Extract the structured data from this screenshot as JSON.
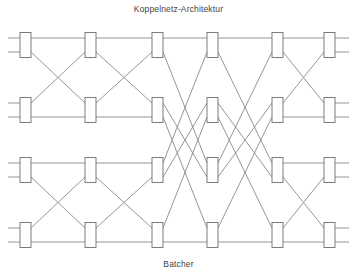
{
  "figure": {
    "title": "Koppelnetz-Architektur",
    "caption": "Batcher",
    "type": "diagram",
    "subtype": "sorting-network",
    "colors": {
      "background": "#ffffff",
      "wire": "#8a8a8a",
      "box_stroke": "#6e6e6e",
      "box_fill": "#ffffff",
      "text": "#3f3f3f"
    },
    "canvas": {
      "width": 357,
      "height": 278
    },
    "wire_rows_y": [
      38,
      52,
      103,
      117,
      163,
      177,
      228,
      242
    ],
    "wire_x_start": 8,
    "wire_x_end": 349,
    "stage_x": [
      20,
      85,
      152,
      207,
      272,
      324
    ],
    "box_width": 11,
    "stages": [
      {
        "index": 1,
        "x": 20,
        "boxes": [
          {
            "top_row": 0,
            "bottom_row": 1
          },
          {
            "top_row": 2,
            "bottom_row": 3
          },
          {
            "top_row": 4,
            "bottom_row": 5
          },
          {
            "top_row": 6,
            "bottom_row": 7
          }
        ]
      },
      {
        "index": 2,
        "x": 85,
        "boxes": [
          {
            "top_row": 0,
            "bottom_row": 1
          },
          {
            "top_row": 2,
            "bottom_row": 3
          },
          {
            "top_row": 4,
            "bottom_row": 5
          },
          {
            "top_row": 6,
            "bottom_row": 7
          }
        ]
      },
      {
        "index": 3,
        "x": 152,
        "boxes": [
          {
            "top_row": 0,
            "bottom_row": 1
          },
          {
            "top_row": 2,
            "bottom_row": 3
          },
          {
            "top_row": 4,
            "bottom_row": 5
          },
          {
            "top_row": 6,
            "bottom_row": 7
          }
        ]
      },
      {
        "index": 4,
        "x": 207,
        "boxes": [
          {
            "top_row": 0,
            "bottom_row": 1
          },
          {
            "top_row": 2,
            "bottom_row": 3
          },
          {
            "top_row": 4,
            "bottom_row": 5
          },
          {
            "top_row": 6,
            "bottom_row": 7
          }
        ]
      },
      {
        "index": 5,
        "x": 272,
        "boxes": [
          {
            "top_row": 0,
            "bottom_row": 1
          },
          {
            "top_row": 2,
            "bottom_row": 3
          },
          {
            "top_row": 4,
            "bottom_row": 5
          },
          {
            "top_row": 6,
            "bottom_row": 7
          }
        ]
      },
      {
        "index": 6,
        "x": 324,
        "boxes": [
          {
            "top_row": 0,
            "bottom_row": 1
          },
          {
            "top_row": 2,
            "bottom_row": 3
          },
          {
            "top_row": 4,
            "bottom_row": 5
          },
          {
            "top_row": 6,
            "bottom_row": 7
          }
        ]
      }
    ],
    "permutations": [
      {
        "from_stage": 1,
        "to_stage": 2,
        "from_x": 31,
        "to_x": 85,
        "pairs": [
          {
            "from_row": 1,
            "to_row": 2
          },
          {
            "from_row": 2,
            "to_row": 1
          },
          {
            "from_row": 5,
            "to_row": 6
          },
          {
            "from_row": 6,
            "to_row": 5
          }
        ]
      },
      {
        "from_stage": 2,
        "to_stage": 3,
        "from_x": 96,
        "to_x": 152,
        "pairs": [
          {
            "from_row": 1,
            "to_row": 2
          },
          {
            "from_row": 2,
            "to_row": 1
          },
          {
            "from_row": 5,
            "to_row": 6
          },
          {
            "from_row": 6,
            "to_row": 5
          }
        ]
      },
      {
        "from_stage": 3,
        "to_stage": 4,
        "from_x": 163,
        "to_x": 207,
        "pairs": [
          {
            "from_row": 1,
            "to_row": 4
          },
          {
            "from_row": 2,
            "to_row": 5
          },
          {
            "from_row": 3,
            "to_row": 6
          },
          {
            "from_row": 4,
            "to_row": 1
          },
          {
            "from_row": 5,
            "to_row": 2
          },
          {
            "from_row": 6,
            "to_row": 3
          }
        ]
      },
      {
        "from_stage": 4,
        "to_stage": 5,
        "from_x": 218,
        "to_x": 272,
        "pairs": [
          {
            "from_row": 1,
            "to_row": 4
          },
          {
            "from_row": 2,
            "to_row": 5
          },
          {
            "from_row": 3,
            "to_row": 6
          },
          {
            "from_row": 4,
            "to_row": 1
          },
          {
            "from_row": 5,
            "to_row": 2
          },
          {
            "from_row": 6,
            "to_row": 3
          }
        ]
      },
      {
        "from_stage": 5,
        "to_stage": 6,
        "from_x": 283,
        "to_x": 324,
        "pairs": [
          {
            "from_row": 1,
            "to_row": 2
          },
          {
            "from_row": 2,
            "to_row": 1
          },
          {
            "from_row": 5,
            "to_row": 6
          },
          {
            "from_row": 6,
            "to_row": 5
          }
        ]
      }
    ],
    "straight_segments": [
      {
        "row": 0,
        "x1": 8,
        "x2": 349
      },
      {
        "row": 3,
        "x1": 8,
        "x2": 163
      },
      {
        "row": 4,
        "x1": 8,
        "x2": 163
      },
      {
        "row": 7,
        "x1": 8,
        "x2": 349
      },
      {
        "row": 0,
        "x1": 8,
        "x2": 349
      },
      {
        "row": 3,
        "x1": 218,
        "x2": 349
      },
      {
        "row": 4,
        "x1": 218,
        "x2": 349
      }
    ]
  }
}
